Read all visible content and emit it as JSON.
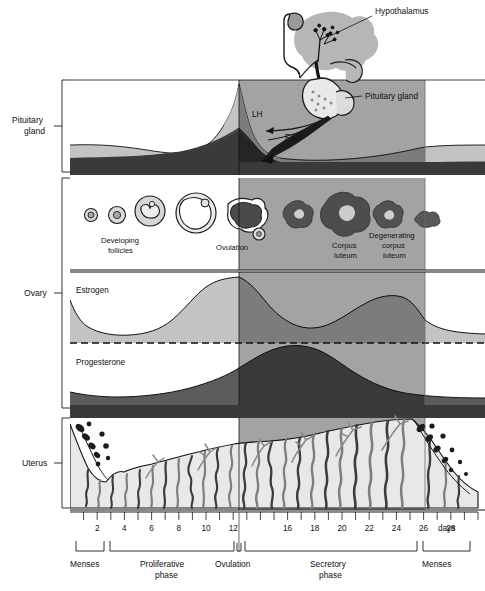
{
  "figure": {
    "type": "biological-timeline-diagram"
  },
  "colors": {
    "page_background": "#ffffff",
    "shade_luteal_overlay": "#8f8f8f",
    "light_gray_band": "#c2c2c2",
    "mid_gray": "#9a9a9a",
    "dark_band": "#3a3a3a",
    "darker_fill": "#5a5a5a",
    "endometrium_fill": "#e6e6e6",
    "gland_gray": "#8c8c8c",
    "ink": "#101010"
  },
  "side_labels": [
    {
      "id": "pituitary-gland",
      "line1": "Pituitary",
      "line2": "gland"
    },
    {
      "id": "ovary",
      "line1": "Ovary",
      "line2": ""
    },
    {
      "id": "uterus",
      "line1": "Uterus",
      "line2": ""
    }
  ],
  "callouts": [
    {
      "id": "hypothalamus",
      "text": "Hypothalamus"
    },
    {
      "id": "pituitary-gland-callout",
      "text": "Pituitary gland"
    },
    {
      "id": "lh",
      "text": "LH"
    },
    {
      "id": "fsh",
      "text": "FSH"
    }
  ],
  "ovary_labels": [
    {
      "id": "developing-follicles",
      "line1": "Developing",
      "line2": "follicles"
    },
    {
      "id": "ovulation",
      "line1": "Ovulation",
      "line2": ""
    },
    {
      "id": "corpus-luteum",
      "line1": "Corpus",
      "line2": "luteum"
    },
    {
      "id": "degenerating-corpus-luteum",
      "line1": "Degenerating",
      "line2": "corpus",
      "line3": "luteum"
    }
  ],
  "hormone_labels": [
    {
      "id": "estrogen",
      "text": "Estrogen"
    },
    {
      "id": "progesterone",
      "text": "Progesterone"
    }
  ],
  "axis": {
    "unit_label": "days",
    "tick_days": [
      1,
      2,
      3,
      4,
      5,
      6,
      7,
      8,
      9,
      10,
      11,
      12,
      13,
      14,
      15,
      16,
      17,
      18,
      19,
      20,
      21,
      22,
      23,
      24,
      25,
      26,
      27,
      28,
      29,
      30
    ],
    "labeled_days": [
      2,
      4,
      6,
      8,
      10,
      12,
      16,
      18,
      20,
      22,
      24,
      26,
      28
    ],
    "range": [
      0,
      30
    ]
  },
  "phases": [
    {
      "id": "menses-start",
      "line1": "Menses",
      "line2": "",
      "start_day": 0,
      "end_day": 3
    },
    {
      "id": "proliferative-phase",
      "line1": "Proliferative",
      "line2": "phase",
      "start_day": 3,
      "end_day": 14
    },
    {
      "id": "ovulation-phase",
      "line1": "Ovulation",
      "line2": "",
      "start_day": 14,
      "end_day": 14
    },
    {
      "id": "secretory-phase",
      "line1": "Secretory",
      "line2": "phase",
      "start_day": 14,
      "end_day": 27.5
    },
    {
      "id": "menses-end",
      "line1": "Menses",
      "line2": "",
      "start_day": 27.5,
      "end_day": 30
    }
  ],
  "chart_data": {
    "type": "area",
    "xlabel": "days",
    "x_range": [
      0,
      30
    ],
    "ovulation_day": 14,
    "shaded_region": {
      "from_day": 14,
      "to_day": 27.5,
      "meaning": "luteal / secretory phase shading"
    },
    "series": [
      {
        "name": "LH",
        "panel": "pituitary",
        "x": [
          0,
          2,
          4,
          6,
          8,
          10,
          11,
          12,
          13,
          13.6,
          14,
          14.4,
          15,
          16,
          18,
          20,
          22,
          24,
          26,
          28,
          30
        ],
        "values": [
          22,
          21,
          20,
          19,
          18,
          19,
          22,
          30,
          55,
          82,
          96,
          70,
          40,
          26,
          20,
          18,
          17,
          17,
          18,
          21,
          22
        ]
      },
      {
        "name": "FSH",
        "panel": "pituitary",
        "x": [
          0,
          2,
          4,
          6,
          8,
          10,
          12,
          13,
          14,
          15,
          16,
          18,
          20,
          22,
          24,
          26,
          28,
          30
        ],
        "values": [
          30,
          29,
          28,
          27,
          26,
          28,
          34,
          42,
          48,
          30,
          22,
          18,
          16,
          16,
          17,
          19,
          24,
          28
        ]
      },
      {
        "name": "Estrogen",
        "panel": "ovary-hormones",
        "x": [
          0,
          1,
          2,
          3,
          4,
          5,
          6,
          7,
          8,
          9,
          10,
          11,
          12,
          13,
          14,
          15,
          16,
          17,
          18,
          19,
          20,
          21,
          22,
          23,
          24,
          25,
          26,
          27,
          28,
          29,
          30
        ],
        "values": [
          38,
          24,
          17,
          15,
          14,
          14,
          15,
          17,
          22,
          32,
          48,
          66,
          82,
          93,
          97,
          92,
          80,
          64,
          52,
          45,
          42,
          44,
          50,
          58,
          66,
          72,
          74,
          70,
          52,
          38,
          34
        ]
      },
      {
        "name": "Progesterone",
        "panel": "ovary-hormones",
        "x": [
          0,
          2,
          4,
          6,
          8,
          10,
          12,
          13,
          14,
          15,
          16,
          17,
          18,
          19,
          20,
          21,
          22,
          23,
          24,
          25,
          26,
          27,
          28,
          29,
          30
        ],
        "values": [
          16,
          13,
          11,
          10,
          10,
          11,
          14,
          18,
          24,
          34,
          46,
          58,
          70,
          80,
          86,
          88,
          86,
          80,
          70,
          58,
          46,
          34,
          24,
          17,
          14
        ]
      },
      {
        "name": "Endometrium thickness",
        "panel": "uterus",
        "x": [
          0,
          1,
          2,
          3,
          4,
          5,
          6,
          8,
          10,
          12,
          14,
          16,
          18,
          20,
          22,
          24,
          26,
          27,
          28,
          29,
          30
        ],
        "values": [
          92,
          70,
          38,
          22,
          24,
          28,
          34,
          44,
          56,
          66,
          76,
          80,
          84,
          88,
          92,
          96,
          100,
          100,
          78,
          52,
          38
        ]
      }
    ],
    "ovary_events": [
      {
        "day": 2,
        "stage": "primordial follicle"
      },
      {
        "day": 4,
        "stage": "primary follicle"
      },
      {
        "day": 7,
        "stage": "secondary follicle"
      },
      {
        "day": 11,
        "stage": "mature (graafian) follicle"
      },
      {
        "day": 14,
        "stage": "ovulation"
      },
      {
        "day": 17,
        "stage": "early corpus luteum"
      },
      {
        "day": 21,
        "stage": "corpus luteum"
      },
      {
        "day": 25,
        "stage": "degenerating corpus luteum"
      },
      {
        "day": 28,
        "stage": "corpus albicans"
      }
    ]
  }
}
